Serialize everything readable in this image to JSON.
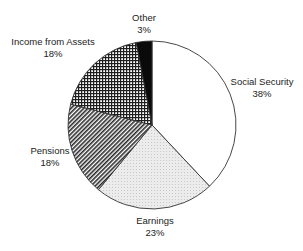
{
  "chart_data": {
    "type": "pie",
    "title": "",
    "categories": [
      "Social Security",
      "Earnings",
      "Pensions",
      "Income from Assets",
      "Other"
    ],
    "values": [
      38,
      23,
      18,
      18,
      3
    ],
    "unit": "%",
    "start_angle_deg": 0,
    "direction": "clockwise",
    "legend": "none (labels placed next to slices)",
    "slices": [
      {
        "label": "Social Security",
        "value": 38,
        "value_label": "38%",
        "fill": "white"
      },
      {
        "label": "Earnings",
        "value": 23,
        "value_label": "23%",
        "fill": "light gray dotted"
      },
      {
        "label": "Pensions",
        "value": 18,
        "value_label": "18%",
        "fill": "diagonal hatch"
      },
      {
        "label": "Income from Assets",
        "value": 18,
        "value_label": "18%",
        "fill": "crosshatch grid"
      },
      {
        "label": "Other",
        "value": 3,
        "value_label": "3%",
        "fill": "black"
      }
    ]
  },
  "labels": {
    "social_security": {
      "name": "Social Security",
      "pct": "38%"
    },
    "earnings": {
      "name": "Earnings",
      "pct": "23%"
    },
    "pensions": {
      "name": "Pensions",
      "pct": "18%"
    },
    "income_from_assets": {
      "name": "Income from Assets",
      "pct": "18%"
    },
    "other": {
      "name": "Other",
      "pct": "3%"
    }
  },
  "colors": {
    "outline": "#333333",
    "other_fill": "#0a0a0a",
    "earnings_fill": "#e6e6e6",
    "text": "#222222"
  }
}
